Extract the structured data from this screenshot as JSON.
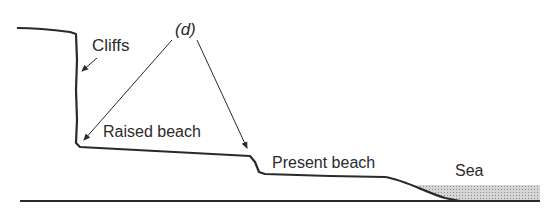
{
  "diagram": {
    "labels": {
      "cliffs": "Cliffs",
      "marker": "(d)",
      "raised_beach": "Raised beach",
      "present_beach": "Present beach",
      "sea": "Sea"
    },
    "colors": {
      "ink": "#2a2a2a",
      "sea_fill": "#bdbdbd",
      "background": "#ffffff"
    }
  }
}
